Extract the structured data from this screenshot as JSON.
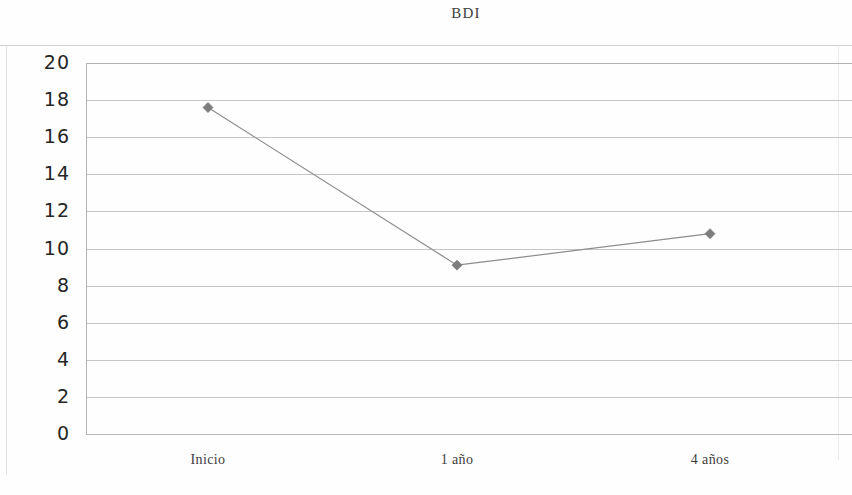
{
  "chart_data": {
    "type": "line",
    "title": "BDI",
    "xlabel": "",
    "ylabel": "",
    "categories": [
      "Inicio",
      "1 año",
      "4 años"
    ],
    "series": [
      {
        "name": "BDI",
        "values": [
          17.6,
          9.1,
          10.8
        ],
        "color": "#8c8c8c",
        "marker": "diamond"
      }
    ],
    "ylim": [
      0,
      20
    ],
    "ytick_labels": [
      "20",
      "18",
      "16",
      "14",
      "12",
      "10",
      "8",
      "6",
      "4",
      "2",
      "0"
    ],
    "ytick_values": [
      20,
      18,
      16,
      14,
      12,
      10,
      8,
      6,
      4,
      2,
      0
    ],
    "grid": true,
    "grid_axis": "y",
    "legend": false,
    "legend_position": "none",
    "annotations": []
  },
  "figure": {
    "title": "BDI",
    "background_color": "#ffffff",
    "axis_color": "#b4b4b4",
    "gridline_color": "#c6c6c6",
    "line_color": "#8c8c8c",
    "marker_color": "#7d7d7d",
    "tick_label_color": "#262626"
  }
}
